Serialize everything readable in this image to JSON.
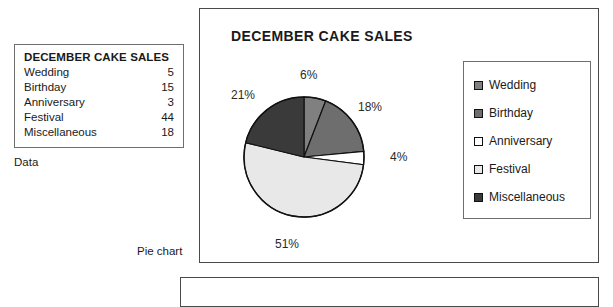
{
  "data_table": {
    "title": "DECEMBER CAKE SALES",
    "caption": "Data",
    "rows": [
      {
        "label": "Wedding",
        "value": "5"
      },
      {
        "label": "Birthday",
        "value": "15"
      },
      {
        "label": "Anniversary",
        "value": "3"
      },
      {
        "label": "Festival",
        "value": "44"
      },
      {
        "label": "Miscellaneous",
        "value": "18"
      }
    ]
  },
  "chart_panel": {
    "title": "DECEMBER CAKE SALES",
    "caption": "Pie chart"
  },
  "legend": {
    "items": [
      {
        "label": "Wedding",
        "color": "#808080"
      },
      {
        "label": "Birthday",
        "color": "#6e6e6e"
      },
      {
        "label": "Anniversary",
        "color": "#ffffff"
      },
      {
        "label": "Festival",
        "color": "#e8e8e8"
      },
      {
        "label": "Miscellaneous",
        "color": "#3a3a3a"
      }
    ]
  },
  "chart_data": {
    "type": "pie",
    "title": "DECEMBER CAKE SALES",
    "labels": [
      "Wedding",
      "Birthday",
      "Anniversary",
      "Festival",
      "Miscellaneous"
    ],
    "values": [
      5,
      15,
      3,
      44,
      18
    ],
    "total": 85,
    "percent_labels": [
      "6%",
      "18%",
      "4%",
      "51%",
      "21%"
    ],
    "percents": [
      6,
      18,
      4,
      51,
      21
    ],
    "colors": [
      "#808080",
      "#6e6e6e",
      "#ffffff",
      "#e8e8e8",
      "#3a3a3a"
    ],
    "start_angle_deg": 0,
    "direction": "clockwise",
    "slice_border": "#111111",
    "legend_position": "right",
    "grid": false,
    "xlabel": "",
    "ylabel": ""
  }
}
